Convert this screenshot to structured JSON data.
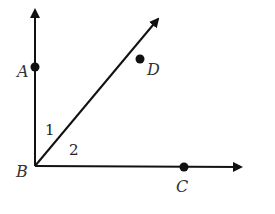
{
  "diagram": {
    "type": "angle-diagram",
    "vertex": {
      "label": "B",
      "x": 35,
      "y": 166
    },
    "rays": [
      {
        "name": "BA",
        "through": "A",
        "direction": "up"
      },
      {
        "name": "BD",
        "through": "D",
        "direction": "up-right"
      },
      {
        "name": "BC",
        "through": "C",
        "direction": "right"
      }
    ],
    "points": [
      {
        "label": "A",
        "x": 35,
        "y": 67
      },
      {
        "label": "D",
        "x": 140,
        "y": 59
      },
      {
        "label": "C",
        "x": 184,
        "y": 167
      },
      {
        "label": "B",
        "x": 35,
        "y": 166
      }
    ],
    "angles": [
      {
        "label": "1",
        "between": "BA and BD"
      },
      {
        "label": "2",
        "between": "BD and BC"
      }
    ],
    "colors": {
      "line": "#111111",
      "text": "#333333",
      "background": "#ffffff"
    }
  }
}
